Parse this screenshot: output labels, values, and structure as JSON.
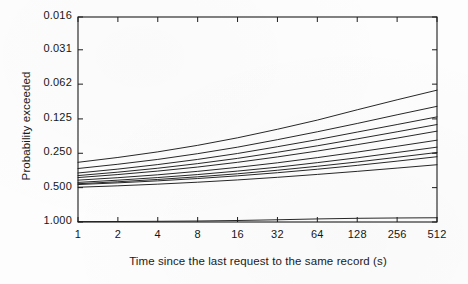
{
  "chart_data": {
    "type": "line",
    "title": "",
    "xlabel": "Time since the last request to the same record (s)",
    "ylabel": "Probability exceeded",
    "x_scale": "log2",
    "y_scale": "log2-reversed",
    "grid": false,
    "legend": null,
    "x_ticks": [
      "1",
      "2",
      "4",
      "8",
      "16",
      "32",
      "64",
      "128",
      "256",
      "512"
    ],
    "x_tick_values": [
      1,
      2,
      4,
      8,
      16,
      32,
      64,
      128,
      256,
      512
    ],
    "y_ticks": [
      "0.016",
      "0.031",
      "0.062",
      "0.125",
      "0.250",
      "0.500",
      "1.000"
    ],
    "y_tick_values": [
      0.016,
      0.031,
      0.062,
      0.125,
      0.25,
      0.5,
      1.0
    ],
    "xlim": [
      1,
      512
    ],
    "ylim_top": 0.016,
    "ylim_bottom": 1.0,
    "x": [
      1,
      2,
      4,
      8,
      16,
      32,
      64,
      128,
      256,
      512
    ],
    "series": [
      {
        "name": "trace-1",
        "values": [
          0.3,
          0.272,
          0.243,
          0.213,
          0.183,
          0.154,
          0.128,
          0.104,
          0.085,
          0.07
        ]
      },
      {
        "name": "trace-2",
        "values": [
          0.34,
          0.312,
          0.283,
          0.252,
          0.221,
          0.19,
          0.162,
          0.137,
          0.115,
          0.097
        ]
      },
      {
        "name": "trace-3",
        "values": [
          0.372,
          0.344,
          0.314,
          0.283,
          0.251,
          0.219,
          0.19,
          0.163,
          0.14,
          0.12
        ]
      },
      {
        "name": "trace-4",
        "values": [
          0.392,
          0.366,
          0.338,
          0.308,
          0.277,
          0.245,
          0.215,
          0.187,
          0.162,
          0.14
        ]
      },
      {
        "name": "trace-5",
        "values": [
          0.408,
          0.384,
          0.358,
          0.33,
          0.3,
          0.269,
          0.239,
          0.21,
          0.184,
          0.16
        ]
      },
      {
        "name": "trace-6",
        "values": [
          0.43,
          0.409,
          0.386,
          0.36,
          0.332,
          0.303,
          0.273,
          0.244,
          0.217,
          0.192
        ]
      },
      {
        "name": "trace-7",
        "values": [
          0.45,
          0.43,
          0.408,
          0.384,
          0.358,
          0.331,
          0.302,
          0.274,
          0.246,
          0.221
        ]
      },
      {
        "name": "trace-8",
        "values": [
          0.462,
          0.444,
          0.424,
          0.402,
          0.378,
          0.352,
          0.325,
          0.298,
          0.271,
          0.246
        ]
      },
      {
        "name": "trace-9",
        "values": [
          0.47,
          0.454,
          0.436,
          0.416,
          0.394,
          0.37,
          0.345,
          0.319,
          0.293,
          0.268
        ]
      },
      {
        "name": "trace-10",
        "values": [
          0.496,
          0.482,
          0.466,
          0.448,
          0.428,
          0.406,
          0.383,
          0.36,
          0.337,
          0.315
        ]
      },
      {
        "name": "trace-11",
        "values": [
          0.992,
          0.99,
          0.986,
          0.98,
          0.97,
          0.956,
          0.94,
          0.928,
          0.922,
          0.918
        ]
      }
    ]
  }
}
